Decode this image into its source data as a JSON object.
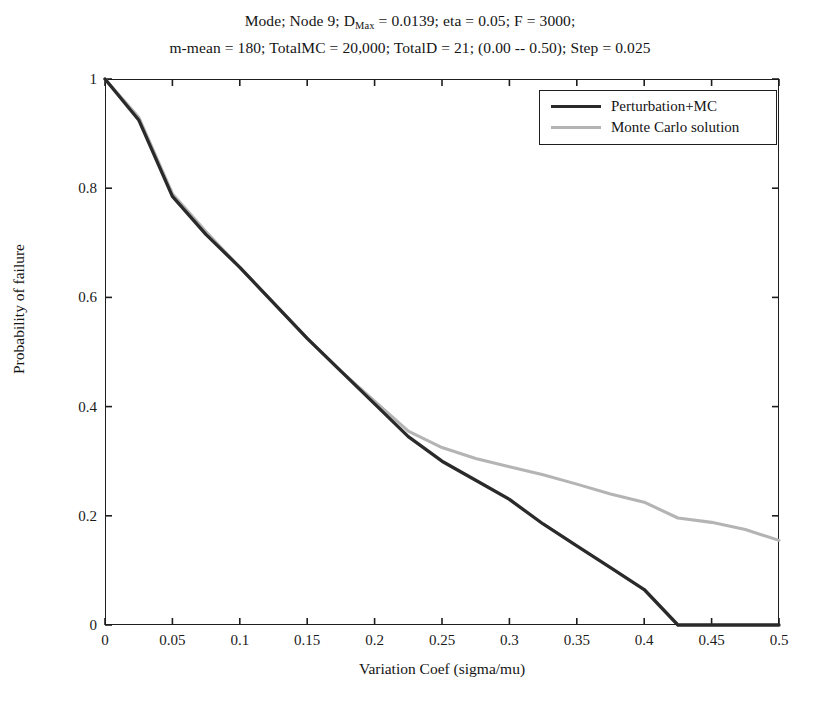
{
  "title": {
    "line1_pre": "Mode;  Node 9; D",
    "line1_sub": "Max",
    "line1_post": " = 0.0139; eta = 0.05; F = 3000;",
    "line2": "m-mean = 180; TotalMC = 20,000; TotalD = 21; (0.00 -- 0.50); Step = 0.025"
  },
  "legend": {
    "entries": [
      {
        "label": "Perturbation+MC",
        "color": "#2a2a2a"
      },
      {
        "label": "Monte Carlo solution",
        "color": "#b4b4b4"
      }
    ]
  },
  "axes": {
    "xlabel": "Variation Coef (sigma/mu)",
    "ylabel": "Probability of failure",
    "xticks": [
      "0",
      "0.05",
      "0.1",
      "0.15",
      "0.2",
      "0.25",
      "0.3",
      "0.35",
      "0.4",
      "0.45",
      "0.5"
    ],
    "yticks": [
      "0",
      "0.2",
      "0.4",
      "0.6",
      "0.8",
      "1"
    ]
  },
  "chart_data": {
    "type": "line",
    "xlabel": "Variation Coef (sigma/mu)",
    "ylabel": "Probability of failure",
    "xlim": [
      0,
      0.5
    ],
    "ylim": [
      0,
      1
    ],
    "xticks": [
      0,
      0.05,
      0.1,
      0.15,
      0.2,
      0.25,
      0.3,
      0.35,
      0.4,
      0.45,
      0.5
    ],
    "yticks": [
      0,
      0.2,
      0.4,
      0.6,
      0.8,
      1
    ],
    "grid": false,
    "legend_position": "upper right",
    "x": [
      0,
      0.025,
      0.05,
      0.075,
      0.1,
      0.125,
      0.15,
      0.175,
      0.2,
      0.225,
      0.25,
      0.275,
      0.3,
      0.325,
      0.35,
      0.375,
      0.4,
      0.425,
      0.45,
      0.475,
      0.5
    ],
    "series": [
      {
        "name": "Perturbation+MC",
        "color": "#2a2a2a",
        "values": [
          1.0,
          0.925,
          0.785,
          0.715,
          0.655,
          0.59,
          0.525,
          0.465,
          0.405,
          0.345,
          0.3,
          0.265,
          0.23,
          0.185,
          0.145,
          0.105,
          0.065,
          0.0,
          0.0,
          0.0,
          0.0
        ]
      },
      {
        "name": "Monte Carlo solution",
        "color": "#b4b4b4",
        "values": [
          1.0,
          0.93,
          0.79,
          0.72,
          0.655,
          0.59,
          0.525,
          0.465,
          0.41,
          0.355,
          0.325,
          0.305,
          0.29,
          0.275,
          0.258,
          0.24,
          0.225,
          0.196,
          0.188,
          0.175,
          0.155
        ]
      }
    ]
  }
}
